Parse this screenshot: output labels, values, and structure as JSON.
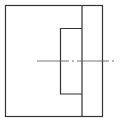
{
  "diagram": {
    "type": "technical-drawing",
    "stroke_color": "#333333",
    "centerline_color": "#555555",
    "background": "#ffffff",
    "outer_rect": {
      "x": 5,
      "y": 5,
      "w": 97,
      "h": 111
    },
    "divider_x": 82,
    "inner_rect": {
      "x": 60,
      "y": 28,
      "w": 22,
      "h": 66
    },
    "centerline": {
      "y": 61,
      "x1": 37,
      "x2": 117
    }
  }
}
